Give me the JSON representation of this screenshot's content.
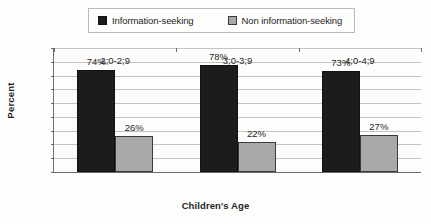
{
  "chart_data": {
    "type": "bar",
    "title": "",
    "xlabel": "Children's Age",
    "ylabel": "Percent",
    "categories": [
      "2;0-2;9",
      "3;0-3;9",
      "4;0-4;9"
    ],
    "series": [
      {
        "name": "Information-seeking",
        "color": "#1c1c1c",
        "values": [
          74,
          78,
          73
        ],
        "labels": [
          "74%",
          "78%",
          "73%"
        ]
      },
      {
        "name": "Non information-seeking",
        "color": "#a9a9a9",
        "values": [
          26,
          22,
          27
        ],
        "labels": [
          "26%",
          "22%",
          "27%"
        ]
      }
    ],
    "ylim": [
      0,
      90
    ],
    "ytick_values": [
      90,
      80,
      70,
      60,
      50,
      40,
      30,
      20,
      10,
      0
    ],
    "ytick_labels": [
      "90%",
      "80%",
      "70%",
      "60%",
      "50%",
      "40%",
      "30%",
      "20%",
      "10%",
      "0%"
    ],
    "grid": true,
    "legend_position": "top"
  },
  "legend": {
    "entries": [
      {
        "label": "Information-seeking",
        "swatch": "dark-swatch-icon"
      },
      {
        "label": "Non information-seeking",
        "swatch": "light-swatch-icon"
      }
    ]
  }
}
